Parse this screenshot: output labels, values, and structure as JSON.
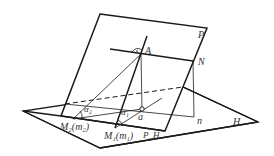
{
  "diagram": {
    "labels": {
      "P": "P",
      "A": "A",
      "N": "N",
      "a": "a",
      "n": "n",
      "H": "H",
      "alpha1": "α₁",
      "alpha2": "α₂",
      "M1": "M₁(m₁)",
      "M2": "M₂(m₂)",
      "PH": "P_H"
    },
    "colors": {
      "stroke": "#1a1a1a",
      "text": "#333333"
    }
  }
}
